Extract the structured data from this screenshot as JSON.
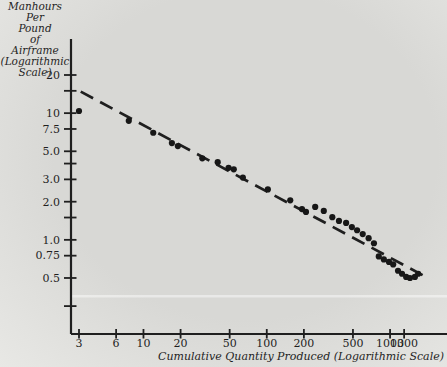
{
  "figure": {
    "y_axis_title_lines": [
      "Manhours",
      "Per",
      "Pound",
      "of",
      "Airframe",
      "(Logarithmic",
      "Scale)"
    ],
    "x_axis_title": "Cumulative Quantity Produced (Logarithmic Scale)"
  },
  "colors": {
    "ink": "#1f1f1f",
    "dot": "#171717",
    "paper_center": "#d8d8d5",
    "paper_edge": "#e8e8e5",
    "artifact": "rgba(255,255,255,0.45)"
  },
  "chart_data": {
    "type": "scatter",
    "title": "",
    "xlabel": "Cumulative Quantity Produced (Logarithmic Scale)",
    "ylabel": "Manhours Per Pound of Airframe (Logarithmic Scale)",
    "x_scale": "log",
    "y_scale": "log",
    "xlim": [
      2.6,
      2100
    ],
    "ylim": [
      0.18,
      38
    ],
    "grid": false,
    "legend": "none",
    "x_ticks": [
      {
        "value": 3,
        "label": "3"
      },
      {
        "value": 6,
        "label": "6"
      },
      {
        "value": 10,
        "label": "10"
      },
      {
        "value": 20,
        "label": "20"
      },
      {
        "value": 50,
        "label": "50"
      },
      {
        "value": 100,
        "label": "100"
      },
      {
        "value": 200,
        "label": "200"
      },
      {
        "value": 500,
        "label": "500"
      },
      {
        "value": 1000,
        "label": "1000"
      },
      {
        "value": 1300,
        "label": "1300"
      }
    ],
    "y_ticks": [
      {
        "value": 20,
        "label": "20"
      },
      {
        "value": 15,
        "label": ""
      },
      {
        "value": 10,
        "label": "10"
      },
      {
        "value": 7.5,
        "label": "7.5"
      },
      {
        "value": 5,
        "label": "5.0"
      },
      {
        "value": 4,
        "label": ""
      },
      {
        "value": 3,
        "label": "3.0"
      },
      {
        "value": 2,
        "label": "2.0"
      },
      {
        "value": 1.5,
        "label": ""
      },
      {
        "value": 1,
        "label": "1.0"
      },
      {
        "value": 0.75,
        "label": "0.75"
      },
      {
        "value": 0.5,
        "label": "0.5"
      },
      {
        "value": 0.3,
        "label": ""
      }
    ],
    "points": [
      [
        3,
        10.4
      ],
      [
        7.6,
        8.7
      ],
      [
        12,
        7.0
      ],
      [
        17,
        5.8
      ],
      [
        19,
        5.5
      ],
      [
        30,
        4.4
      ],
      [
        40,
        4.1
      ],
      [
        49,
        3.7
      ],
      [
        54,
        3.6
      ],
      [
        64,
        3.1
      ],
      [
        102,
        2.5
      ],
      [
        155,
        2.05
      ],
      [
        193,
        1.75
      ],
      [
        208,
        1.66
      ],
      [
        247,
        1.82
      ],
      [
        290,
        1.69
      ],
      [
        340,
        1.51
      ],
      [
        385,
        1.41
      ],
      [
        440,
        1.36
      ],
      [
        490,
        1.26
      ],
      [
        540,
        1.19
      ],
      [
        600,
        1.11
      ],
      [
        670,
        1.03
      ],
      [
        740,
        0.94
      ],
      [
        810,
        0.74
      ],
      [
        890,
        0.7
      ],
      [
        980,
        0.67
      ],
      [
        1060,
        0.64
      ],
      [
        1160,
        0.57
      ],
      [
        1250,
        0.54
      ],
      [
        1350,
        0.51
      ],
      [
        1450,
        0.5
      ],
      [
        1590,
        0.51
      ],
      [
        1690,
        0.54
      ]
    ],
    "trend_line": {
      "style": "dashed",
      "from": [
        3.1,
        14.8
      ],
      "to": [
        2030,
        0.5
      ]
    }
  }
}
